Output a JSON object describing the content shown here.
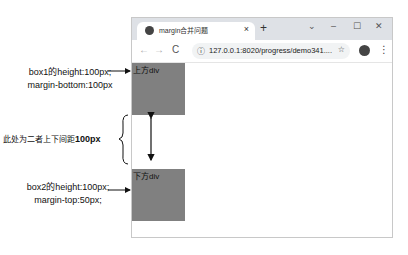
{
  "annotations": {
    "box1_line1": "box1的height:100px;",
    "box1_line2": "margin-bottom:100px",
    "gap_text": "此处为二者上下间距",
    "gap_value": "100px",
    "box2_line1": "box2的height:100px;",
    "box2_line2": "margin-top:50px;"
  },
  "browser": {
    "tab_title": "margin合并问题",
    "tab_close": "×",
    "new_tab": "+",
    "window_controls": {
      "dropdown": "⌄",
      "minimize": "–",
      "maximize": "☐",
      "close": "✕"
    },
    "nav": {
      "back": "←",
      "forward": "→",
      "reload": "C"
    },
    "url": "127.0.0.1:8020/progress/demo341....",
    "info_icon": "ⓘ",
    "star_icon": "☆",
    "menu_icon": "⋮"
  },
  "page": {
    "top_box_label": "上方div",
    "bottom_box_label": "下方div",
    "box_color": "#808080"
  }
}
